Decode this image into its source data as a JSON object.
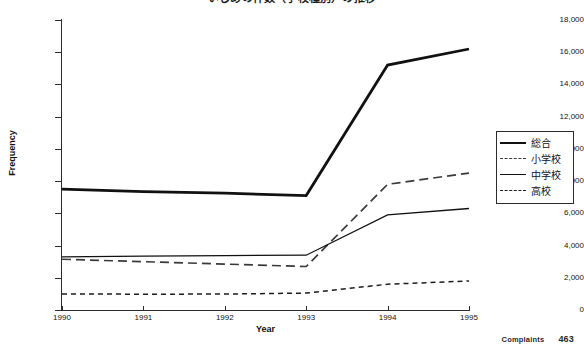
{
  "chart_data": {
    "type": "line",
    "title": "いじめの件数（学校種別）の推移",
    "xlabel": "Year",
    "ylabel": "Frequency",
    "x": [
      1990,
      1991,
      1992,
      1993,
      1994,
      1995
    ],
    "xtick_labels": [
      "1990",
      "1991",
      "1992",
      "1993",
      "1994",
      "1995"
    ],
    "ytick_labels": [
      "0",
      "2,000",
      "4,000",
      "6,000",
      "8,000",
      "10,000",
      "12,000",
      "14,000",
      "16,000",
      "18,000"
    ],
    "ytick_values": [
      0,
      2000,
      4000,
      6000,
      8000,
      10000,
      12000,
      14000,
      16000,
      18000
    ],
    "ylim": [
      0,
      18000
    ],
    "xlim": [
      1990,
      1995
    ],
    "grid": false,
    "legend_position": "right",
    "series": [
      {
        "name": "総合",
        "style": "thick-solid",
        "color": "#111111",
        "values": [
          7500,
          7350,
          7250,
          7100,
          15200,
          16200
        ]
      },
      {
        "name": "小学校",
        "style": "long-dash",
        "color": "#3a3a3a",
        "values": [
          3150,
          3000,
          2850,
          2700,
          7800,
          8500
        ]
      },
      {
        "name": "中学校",
        "style": "thin-solid",
        "color": "#111111",
        "values": [
          3300,
          3350,
          3380,
          3400,
          5900,
          6300
        ]
      },
      {
        "name": "高校",
        "style": "short-dash",
        "color": "#1d1d1d",
        "values": [
          1000,
          980,
          990,
          1050,
          1600,
          1800
        ]
      }
    ]
  },
  "footer": {
    "caption": "Complaints",
    "page": "463"
  }
}
